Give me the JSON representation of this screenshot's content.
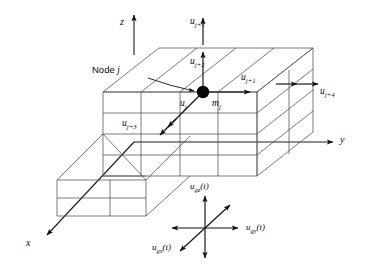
{
  "figure": {
    "background_color": "#ffffff",
    "line_color": "#58585a",
    "ink_color": "#0a0a0a"
  },
  "axes": [
    {
      "name": "z-axis",
      "label": "z",
      "direction": "up"
    },
    {
      "name": "y-axis",
      "label": "y",
      "direction": "right"
    },
    {
      "name": "x-axis",
      "label": "x",
      "direction": "down-left"
    }
  ],
  "node": {
    "callout_label": "Node",
    "callout_index": "j",
    "mass_symbol": "m",
    "mass_subscript": "j",
    "marker": "node-dot"
  },
  "dofs": [
    {
      "name": "dof-uj",
      "symbol": "u",
      "subscript": "j",
      "arrow": "single",
      "direction": "down-left",
      "kind": "translation"
    },
    {
      "name": "dof-uj1",
      "symbol": "u",
      "subscript": "j+1",
      "arrow": "single",
      "direction": "right",
      "kind": "translation"
    },
    {
      "name": "dof-uj2",
      "symbol": "u",
      "subscript": "j+2",
      "arrow": "single",
      "direction": "up",
      "kind": "translation"
    },
    {
      "name": "dof-uj3",
      "symbol": "u",
      "subscript": "j+3",
      "arrow": "double",
      "direction": "down-left",
      "kind": "rotation"
    },
    {
      "name": "dof-uj4",
      "symbol": "u",
      "subscript": "j+4",
      "arrow": "double",
      "direction": "right",
      "kind": "rotation"
    },
    {
      "name": "dof-uj5",
      "symbol": "u",
      "subscript": "j+5",
      "arrow": "double",
      "direction": "up",
      "kind": "rotation"
    }
  ],
  "ground_motion": {
    "components": [
      {
        "name": "ground-motion-z",
        "symbol": "u",
        "subscript": "gz",
        "argument": "(t)",
        "direction": "vertical"
      },
      {
        "name": "ground-motion-y",
        "symbol": "u",
        "subscript": "gy",
        "argument": "(t)",
        "direction": "horizontal"
      },
      {
        "name": "ground-motion-x",
        "symbol": "u",
        "subscript": "gx",
        "argument": "(t)",
        "direction": "diagonal"
      }
    ]
  }
}
